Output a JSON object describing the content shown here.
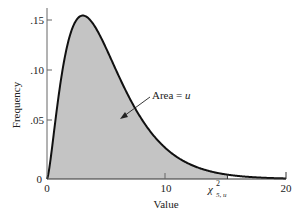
{
  "chart_data": {
    "type": "area",
    "title": "",
    "xlabel": "Value",
    "ylabel": "Frequency",
    "xlim": [
      0,
      20
    ],
    "ylim": [
      0,
      0.16
    ],
    "x_ticks": [
      "0",
      "10",
      "20"
    ],
    "y_ticks": [
      "0",
      ".05",
      ".10",
      ".15"
    ],
    "distribution": "chi-square",
    "degrees_of_freedom": 5,
    "series": [
      {
        "name": "chi-square pdf (df=5)",
        "x": [
          0,
          1,
          2,
          3,
          4,
          5,
          6,
          7,
          8,
          9,
          10,
          11,
          12,
          13,
          14,
          15,
          16,
          17,
          18,
          19,
          20
        ],
        "values": [
          0,
          0.08,
          0.138,
          0.154,
          0.144,
          0.122,
          0.097,
          0.074,
          0.055,
          0.04,
          0.028,
          0.02,
          0.014,
          0.01,
          0.007,
          0.005,
          0.003,
          0.002,
          0.0015,
          0.001,
          0.0007
        ]
      }
    ],
    "shaded_region": {
      "from": 0,
      "to": 15.1,
      "label": "Area = u"
    },
    "critical_value_label": {
      "base": "χ",
      "sup": "2",
      "sub": "5, u",
      "x": 15.1
    },
    "annotation": "Area = u",
    "grid": false,
    "legend": null
  },
  "labels": {
    "xlabel": "Value",
    "ylabel": "Frequency",
    "annotation": "Area = ",
    "annotation_var": "u",
    "chi": "χ",
    "chi_sup": "2",
    "chi_sub": "5, u",
    "xt0": "0",
    "xt10": "10",
    "xt20": "20",
    "yt0": "0",
    "yt05": ".05",
    "yt10": ".10",
    "yt15": ".15"
  },
  "colors": {
    "fill": "#c4c4c4",
    "curve": "#111111",
    "axis": "#555555"
  }
}
